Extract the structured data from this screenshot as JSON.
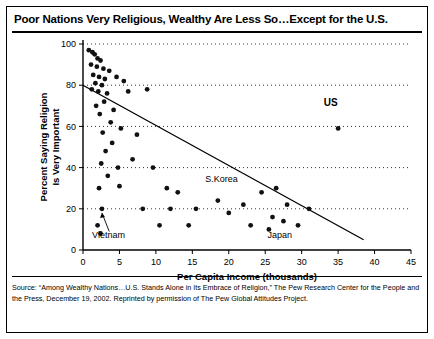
{
  "title": "Poor Nations Very Religious, Wealthy Are Less So…Except for the U.S.",
  "source": {
    "line1": "Source: “Among Wealthy Nations…U.S. Stands Alone in Its Embrace of Religion,” The Pew Research Center for the People and",
    "line2": "the Press, December 19, 2002. Reprinted by permission of The Pew Global Attitudes Project."
  },
  "chart_data": {
    "type": "scatter",
    "title": "Poor Nations Very Religious, Wealthy Are Less So…Except for the U.S.",
    "xlabel": "Per Capita Income (thousands)",
    "ylabel": "Percent Saying Religion Is Very Important",
    "xlim": [
      0,
      45
    ],
    "ylim": [
      0,
      100
    ],
    "xticks": [
      0,
      5,
      10,
      15,
      20,
      25,
      30,
      35,
      40,
      45
    ],
    "yticks": [
      0,
      20,
      40,
      60,
      80,
      100
    ],
    "grid": "horizontal-dotted",
    "legend": "none",
    "points": [
      {
        "x": 0.8,
        "y": 97
      },
      {
        "x": 1.3,
        "y": 96
      },
      {
        "x": 1.6,
        "y": 95
      },
      {
        "x": 2.0,
        "y": 93
      },
      {
        "x": 2.4,
        "y": 92
      },
      {
        "x": 1.1,
        "y": 90
      },
      {
        "x": 1.9,
        "y": 89
      },
      {
        "x": 2.8,
        "y": 88
      },
      {
        "x": 3.6,
        "y": 87
      },
      {
        "x": 1.4,
        "y": 85
      },
      {
        "x": 2.2,
        "y": 84
      },
      {
        "x": 3.0,
        "y": 83
      },
      {
        "x": 4.6,
        "y": 84
      },
      {
        "x": 1.7,
        "y": 81
      },
      {
        "x": 2.6,
        "y": 80
      },
      {
        "x": 5.6,
        "y": 82
      },
      {
        "x": 1.2,
        "y": 78
      },
      {
        "x": 2.1,
        "y": 77
      },
      {
        "x": 3.3,
        "y": 76
      },
      {
        "x": 6.2,
        "y": 77
      },
      {
        "x": 8.8,
        "y": 78
      },
      {
        "x": 2.9,
        "y": 72
      },
      {
        "x": 1.8,
        "y": 70
      },
      {
        "x": 4.2,
        "y": 68
      },
      {
        "x": 2.3,
        "y": 66
      },
      {
        "x": 3.8,
        "y": 62
      },
      {
        "x": 5.2,
        "y": 59
      },
      {
        "x": 2.7,
        "y": 57
      },
      {
        "x": 7.4,
        "y": 56
      },
      {
        "x": 4.0,
        "y": 52
      },
      {
        "x": 3.1,
        "y": 48
      },
      {
        "x": 6.8,
        "y": 44
      },
      {
        "x": 2.5,
        "y": 42
      },
      {
        "x": 4.8,
        "y": 40
      },
      {
        "x": 9.6,
        "y": 40
      },
      {
        "x": 3.4,
        "y": 36
      },
      {
        "x": 2.2,
        "y": 30
      },
      {
        "x": 5.0,
        "y": 31
      },
      {
        "x": 11.5,
        "y": 30
      },
      {
        "x": 13.0,
        "y": 28
      },
      {
        "x": 18.5,
        "y": 24
      },
      {
        "x": 24.5,
        "y": 28
      },
      {
        "x": 26.5,
        "y": 30
      },
      {
        "x": 28.0,
        "y": 22
      },
      {
        "x": 2.6,
        "y": 20
      },
      {
        "x": 8.2,
        "y": 20
      },
      {
        "x": 12.0,
        "y": 20
      },
      {
        "x": 15.5,
        "y": 20
      },
      {
        "x": 20.0,
        "y": 18
      },
      {
        "x": 22.0,
        "y": 22
      },
      {
        "x": 26.0,
        "y": 16
      },
      {
        "x": 27.5,
        "y": 14
      },
      {
        "x": 29.5,
        "y": 12
      },
      {
        "x": 31.0,
        "y": 20
      },
      {
        "x": 2.0,
        "y": 12
      },
      {
        "x": 10.5,
        "y": 12
      },
      {
        "x": 14.5,
        "y": 12
      },
      {
        "x": 23.0,
        "y": 12
      },
      {
        "x": 25.5,
        "y": 10
      },
      {
        "x": 2.4,
        "y": 8
      },
      {
        "x": 35.0,
        "y": 59
      }
    ],
    "highlight_points": [
      {
        "label": "US",
        "x": 35.0,
        "y": 59
      }
    ],
    "trendline": {
      "x0": 0,
      "y0": 80,
      "x1": 38.5,
      "y1": 5
    },
    "annotations": [
      {
        "text": "US",
        "x": 34.0,
        "y": 70,
        "style": "bold"
      },
      {
        "text": "S.Korea",
        "x": 19.0,
        "y": 33,
        "style": "plain"
      },
      {
        "text": "Vietnam",
        "x": 3.5,
        "y": 6,
        "style": "plain"
      },
      {
        "text": "Japan",
        "x": 27.0,
        "y": 6,
        "style": "plain"
      }
    ]
  }
}
